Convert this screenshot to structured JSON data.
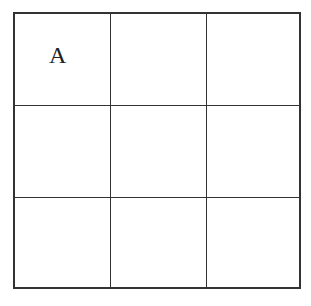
{
  "diagram": {
    "type": "3x3 grid",
    "rows": 3,
    "cols": 3,
    "cells": [
      [
        "A",
        "",
        ""
      ],
      [
        "",
        "",
        ""
      ],
      [
        "",
        "",
        ""
      ]
    ],
    "line_color": "#333333",
    "background": "#ffffff"
  }
}
